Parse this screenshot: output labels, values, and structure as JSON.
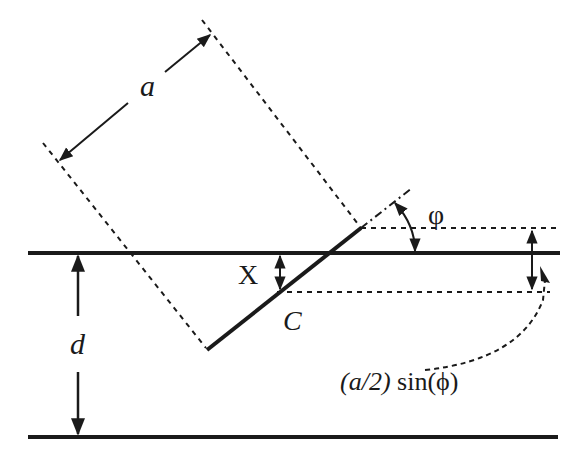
{
  "diagram": {
    "type": "geometry-schematic",
    "labels": {
      "width": "a",
      "angle": "φ",
      "offset": "X",
      "center": "C",
      "thickness": "d",
      "formula_italic": "(a/2)",
      "formula_rest": " sin(ϕ)"
    },
    "colors": {
      "line": "#1a1a1a",
      "background": "#ffffff"
    }
  }
}
